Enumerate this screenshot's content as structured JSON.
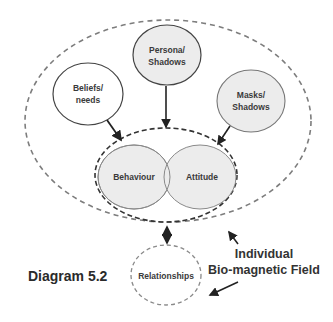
{
  "diagram": {
    "caption": "Diagram 5.2",
    "nodes": {
      "persona": {
        "line1": "Persona/",
        "line2": "Shadows",
        "fill": "#ececec"
      },
      "beliefs": {
        "line1": "Beliefs/",
        "line2": "needs",
        "fill": "#ffffff"
      },
      "masks": {
        "line1": "Masks/",
        "line2": "Shadows",
        "fill": "#ececec"
      },
      "behaviour": {
        "label": "Behaviour",
        "fill": "#ececec"
      },
      "attitude": {
        "label": "Attitude",
        "fill": "#ececec"
      },
      "relationships": {
        "label": "Relationships",
        "fill": "#ffffff"
      }
    },
    "field_label": {
      "line1": "Individual",
      "line2": "Bio-magnetic Field"
    },
    "edges": [
      {
        "from": "persona",
        "to": "self",
        "type": "arrow"
      },
      {
        "from": "beliefs",
        "to": "self",
        "type": "arrow"
      },
      {
        "from": "masks",
        "to": "self",
        "type": "arrow"
      },
      {
        "from": "self",
        "to": "relationships",
        "type": "double-arrow"
      },
      {
        "from": "field_label",
        "to": "outer-field",
        "type": "arrow"
      },
      {
        "from": "field_label",
        "to": "relationships",
        "type": "arrow"
      }
    ],
    "colors": {
      "line": "#222222",
      "dash": "#7a7a7a",
      "circle_stroke": "#555555"
    }
  }
}
